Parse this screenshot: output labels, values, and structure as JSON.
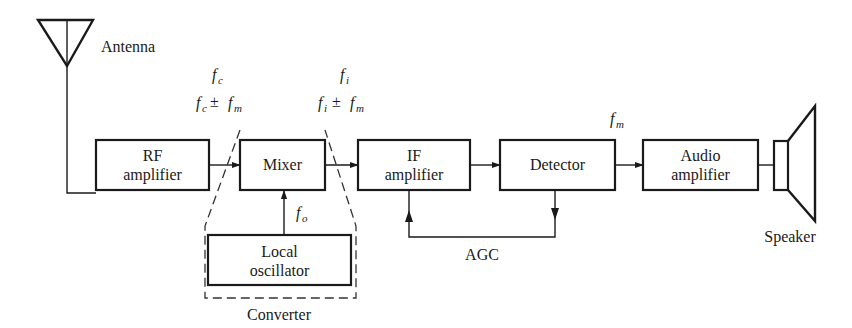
{
  "diagram": {
    "blocks": {
      "rf_amplifier": {
        "line1": "RF",
        "line2": "amplifier"
      },
      "mixer": {
        "line1": "Mixer"
      },
      "local_oscillator": {
        "line1": "Local",
        "line2": "oscillator"
      },
      "if_amplifier": {
        "line1": "IF",
        "line2": "amplifier"
      },
      "detector": {
        "line1": "Detector"
      },
      "audio_amplifier": {
        "line1": "Audio",
        "line2": "amplifier"
      }
    },
    "labels": {
      "antenna": "Antenna",
      "speaker": "Speaker",
      "converter": "Converter",
      "agc": "AGC"
    },
    "signals": {
      "rf_in": {
        "top": {
          "f": "f",
          "sub": "c"
        },
        "bottom": {
          "f1": "f",
          "sub1": "c",
          "op": "±",
          "f2": "f",
          "sub2": "m"
        }
      },
      "if_out": {
        "top": {
          "f": "f",
          "sub": "i"
        },
        "bottom": {
          "f1": "f",
          "sub1": "i",
          "op": "±",
          "f2": "f",
          "sub2": "m"
        }
      },
      "lo": {
        "f": "f",
        "sub": "o"
      },
      "audio": {
        "f": "f",
        "sub": "m"
      }
    },
    "colors": {
      "ink": "#1a1a1a",
      "background": "#ffffff"
    }
  }
}
